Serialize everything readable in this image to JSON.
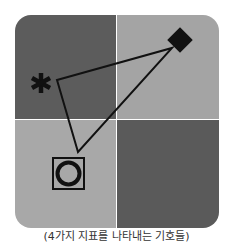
{
  "diagram": {
    "quadrants": [
      {
        "name": "top-left",
        "color": "#5c5c5c"
      },
      {
        "name": "top-right",
        "color": "#a4a4a4"
      },
      {
        "name": "bottom-left",
        "color": "#a8a8a8"
      },
      {
        "name": "bottom-right",
        "color": "#5a5a5a"
      }
    ],
    "markers": [
      {
        "name": "asterisk",
        "icon": "asterisk-icon",
        "quadrant": "top-left"
      },
      {
        "name": "diamond",
        "icon": "diamond-icon",
        "quadrant": "top-right"
      },
      {
        "name": "circle-in-square",
        "icon": "circle-in-square-icon",
        "quadrant": "bottom-left"
      }
    ],
    "connector": "triangle linking asterisk, diamond and circle-in-square markers",
    "marker_color": "#111111",
    "caption": "(4가지 지표를 나타내는 기호들)"
  }
}
